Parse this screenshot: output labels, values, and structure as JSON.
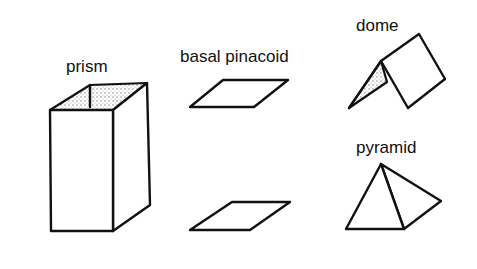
{
  "labels": {
    "prism": "prism",
    "basal_pinacoid": "basal pinacoid",
    "dome": "dome",
    "pyramid": "pyramid"
  },
  "colors": {
    "stroke": "#111111",
    "background": "#ffffff",
    "shading": "#9a9a9a"
  },
  "figures": [
    {
      "name": "prism",
      "shape": "rectangular prism, open top with stippled interior"
    },
    {
      "name": "basal pinacoid",
      "shape": "two parallel parallelograms (top and bottom)"
    },
    {
      "name": "dome",
      "shape": "two inclined faces meeting at ridge, one stippled"
    },
    {
      "name": "pyramid",
      "shape": "tetrahedral pyramid with visible edge"
    }
  ]
}
